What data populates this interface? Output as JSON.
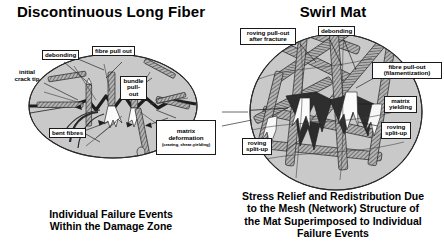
{
  "figure": {
    "type": "technical-diagram"
  },
  "panels": [
    {
      "id": "discontinuous-long-fiber",
      "title": "Discontinuous Long Fiber",
      "caption": "Individual Failure Events\nWithin the Damage Zone",
      "shape": "ellipse",
      "labels": [
        {
          "key": "debonding",
          "text": "debonding"
        },
        {
          "key": "fibre_pull_out",
          "text": "fibre pull out"
        },
        {
          "key": "initial_crack_tip",
          "text": "initial\ncrack tip"
        },
        {
          "key": "bundle_pull_out",
          "text": "bundle\npull-out"
        },
        {
          "key": "bent_fibres",
          "text": "bent fibres"
        },
        {
          "key": "matrix_deformation",
          "text": "matrix deformation"
        },
        {
          "key": "matrix_deformation_sub",
          "text": "(crazing, shear-yielding)"
        }
      ]
    },
    {
      "id": "swirl-mat",
      "title": "Swirl Mat",
      "caption": "Stress Relief and Redistribution Due\nto the Mesh (Network) Structure of\nthe Mat Superimposed to Individual\nFailure Events",
      "shape": "circle",
      "labels": [
        {
          "key": "roving_pull_out",
          "text": "roving pull-out\nafter fracture"
        },
        {
          "key": "debonding",
          "text": "debonding"
        },
        {
          "key": "fibre_pull_out",
          "text": "fibre pull-out\n(filamentization)"
        },
        {
          "key": "matrix_yielding",
          "text": "matrix\nyielding"
        },
        {
          "key": "roving_split_up_right",
          "text": "roving\nsplit-up"
        },
        {
          "key": "roving_split_up_left",
          "text": "roving\nsplit-up"
        }
      ]
    }
  ],
  "colors": {
    "background": "#ffffff",
    "ink": "#1a1a1a",
    "matrix_fill": "#c9c9c9",
    "fiber_fill": "#a8a8a8",
    "fracture_dark": "#2e2e2e",
    "void_light": "#f4f4f4"
  }
}
